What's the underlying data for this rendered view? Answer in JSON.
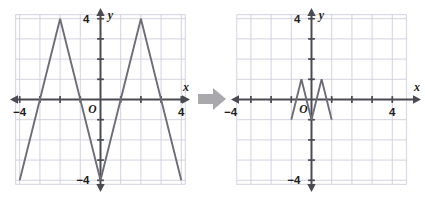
{
  "figure": {
    "arrow_icon": "right-arrow-icon",
    "arrow_color": "#a9a9ad",
    "grid_color": "#cfcddc",
    "axis_color": "#4a4a52",
    "curve_color": "#6d6d78",
    "background": "#ffffff"
  },
  "panels": [
    {
      "id": "left",
      "name": "original-graph",
      "axis_labels": {
        "x": "x",
        "y": "y",
        "origin": "O"
      },
      "x_tick_labels": [
        {
          "value": -4,
          "text": "−4"
        },
        {
          "value": 4,
          "text": "4"
        }
      ],
      "y_tick_labels": [
        {
          "value": 4,
          "text": "4"
        },
        {
          "value": -4,
          "text": "−4"
        }
      ],
      "chart": {
        "type": "line",
        "title": "",
        "xlabel": "x",
        "ylabel": "y",
        "xlim": [
          -5,
          5
        ],
        "ylim": [
          -5,
          5
        ],
        "grid": true,
        "grid_step": 1,
        "legend": "none",
        "series": [
          {
            "name": "f(x)",
            "points": [
              [
                -4,
                -4
              ],
              [
                -2,
                4
              ],
              [
                0,
                -4
              ],
              [
                2,
                4
              ],
              [
                4,
                -4
              ]
            ]
          }
        ]
      }
    },
    {
      "id": "right",
      "name": "transformed-graph",
      "axis_labels": {
        "x": "x",
        "y": "y",
        "origin": "O"
      },
      "x_tick_labels": [
        {
          "value": -4,
          "text": "−4"
        },
        {
          "value": 4,
          "text": "4"
        }
      ],
      "y_tick_labels": [
        {
          "value": 4,
          "text": "4"
        },
        {
          "value": -4,
          "text": "−4"
        }
      ],
      "chart": {
        "type": "line",
        "title": "",
        "xlabel": "x",
        "ylabel": "y",
        "xlim": [
          -5,
          5
        ],
        "ylim": [
          -5,
          5
        ],
        "grid": true,
        "grid_step": 1,
        "legend": "none",
        "series": [
          {
            "name": "f(4x)",
            "points": [
              [
                -1,
                -1
              ],
              [
                -0.5,
                1
              ],
              [
                0,
                -1
              ],
              [
                0.5,
                1
              ],
              [
                1,
                -1
              ]
            ]
          }
        ]
      }
    }
  ]
}
